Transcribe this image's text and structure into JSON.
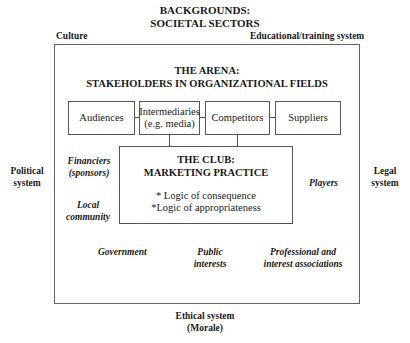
{
  "backgrounds": {
    "title_line1": "BACKGROUNDS:",
    "title_line2": "SOCIETAL SECTORS",
    "culture": "Culture",
    "educational": "Educational/training system",
    "political_line1": "Political",
    "political_line2": "system",
    "legal_line1": "Legal",
    "legal_line2": "system",
    "ethical_line1": "Ethical system",
    "ethical_line2": "(Morale)"
  },
  "arena": {
    "title_line1": "THE ARENA:",
    "title_line2": "STAKEHOLDERS IN ORGANIZATIONAL FIELDS",
    "boxes": [
      {
        "line1": "Audiences",
        "line2": ""
      },
      {
        "line1": "Intermediaries",
        "line2": "(e.g. media)"
      },
      {
        "line1": "Competitors",
        "line2": ""
      },
      {
        "line1": "Suppliers",
        "line2": ""
      }
    ],
    "stakeholders": {
      "financiers_line1": "Financiers",
      "financiers_line2": "(sponsors)",
      "local_line1": "Local",
      "local_line2": "community",
      "players": "Players",
      "government": "Government",
      "public_line1": "Public",
      "public_line2": "interests",
      "professional_line1": "Professional and",
      "professional_line2": "interest associations"
    }
  },
  "club": {
    "title_line1": "THE CLUB:",
    "title_line2": "MARKETING PRACTICE",
    "logic1": "* Logic of consequence",
    "logic2": "*Logic of appropriateness"
  }
}
